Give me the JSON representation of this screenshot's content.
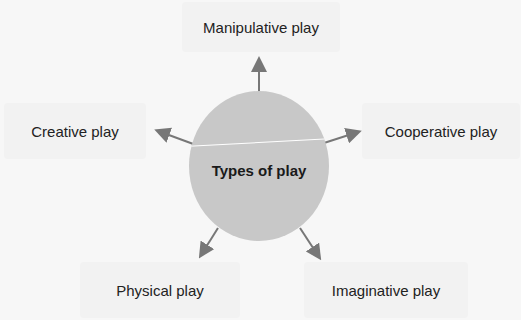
{
  "diagram": {
    "center": {
      "label": "Types of play"
    },
    "nodes": [
      {
        "id": "manipulative",
        "label": "Manipulative play",
        "position": "top"
      },
      {
        "id": "creative",
        "label": "Creative play",
        "position": "left"
      },
      {
        "id": "cooperative",
        "label": "Cooperative play",
        "position": "right"
      },
      {
        "id": "physical",
        "label": "Physical play",
        "position": "bottom-left"
      },
      {
        "id": "imaginative",
        "label": "Imaginative play",
        "position": "bottom-right"
      }
    ],
    "colors": {
      "background": "#f7f7f7",
      "node_box": "#f2f2f2",
      "center_circle": "#c8c8c8",
      "arrow": "#777777",
      "text": "#222222"
    }
  }
}
